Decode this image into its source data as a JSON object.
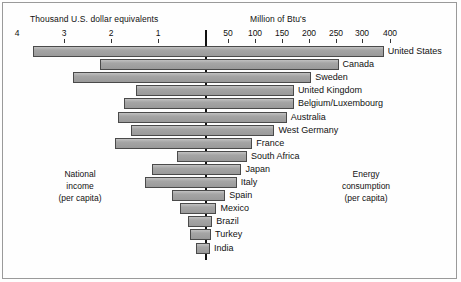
{
  "chart_data": {
    "type": "bar",
    "title": "",
    "orientation": "diverging-horizontal",
    "axis_left": {
      "title": "Thousand U.S. dollar equivalents",
      "label": "National income (per capita)",
      "tick_labels": [
        "4",
        "3",
        "2",
        "1"
      ],
      "tick_values": [
        4,
        3,
        2,
        1
      ],
      "direction": "right-to-left",
      "units": "Thousand U.S. dollar equivalents"
    },
    "axis_right": {
      "title": "Million of Btu's",
      "label": "Energy consumption (per capita)",
      "tick_labels": [
        "50",
        "100",
        "150",
        "200",
        "250",
        "300",
        "400"
      ],
      "tick_values": [
        50,
        100,
        150,
        200,
        250,
        300,
        400
      ],
      "direction": "left-to-right",
      "units": "Million of Btu's"
    },
    "note_left": {
      "line1": "National",
      "line2": "income",
      "line3": "(per capita)"
    },
    "note_right": {
      "line1": "Energy",
      "line2": "consumption",
      "line3": "(per capita)"
    },
    "categories": [
      "United States",
      "Canada",
      "Sweden",
      "United Kingdom",
      "Belgium/Luxembourg",
      "Australia",
      "West Germany",
      "France",
      "South Africa",
      "Japan",
      "Italy",
      "Spain",
      "Mexico",
      "Brazil",
      "Turkey",
      "India"
    ],
    "series": [
      {
        "name": "National income (per capita), thousand U.S. dollar equivalents",
        "side": "left",
        "values": [
          3.65,
          2.23,
          2.81,
          1.46,
          1.72,
          1.85,
          1.57,
          1.91,
          0.6,
          1.13,
          1.27,
          0.7,
          0.53,
          0.36,
          0.32,
          0.19
        ]
      },
      {
        "name": "Energy consumption (per capita), million of Btu's",
        "side": "right",
        "values": [
          378,
          255,
          204,
          172,
          172,
          159,
          136,
          95,
          85,
          75,
          66,
          44,
          25,
          16,
          13,
          11
        ]
      }
    ],
    "bars": [
      {
        "label": "United States",
        "income": 3.65,
        "energy": 378
      },
      {
        "label": "Canada",
        "income": 2.23,
        "energy": 255
      },
      {
        "label": "Sweden",
        "income": 2.81,
        "energy": 204
      },
      {
        "label": "United Kingdom",
        "income": 1.46,
        "energy": 172
      },
      {
        "label": "Belgium/Luxembourg",
        "income": 1.72,
        "energy": 172
      },
      {
        "label": "Australia",
        "income": 1.85,
        "energy": 159
      },
      {
        "label": "West Germany",
        "income": 1.57,
        "energy": 136
      },
      {
        "label": "France",
        "income": 1.91,
        "energy": 95
      },
      {
        "label": "South Africa",
        "income": 0.6,
        "energy": 85
      },
      {
        "label": "Japan",
        "income": 1.13,
        "energy": 75
      },
      {
        "label": "Italy",
        "income": 1.27,
        "energy": 66
      },
      {
        "label": "Spain",
        "income": 0.7,
        "energy": 44
      },
      {
        "label": "Mexico",
        "income": 0.53,
        "energy": 25
      },
      {
        "label": "Brazil",
        "income": 0.36,
        "energy": 16
      },
      {
        "label": "Turkey",
        "income": 0.32,
        "energy": 13
      },
      {
        "label": "India",
        "income": 0.19,
        "energy": 11
      }
    ],
    "colors": {
      "bar_fill": "#a0a0a0",
      "bar_stroke": "#4a4a4a",
      "axis": "#111111",
      "background": "#ffffff"
    },
    "grid": false,
    "legend": "none"
  },
  "geometry": {
    "center_x": 205,
    "left_px_per_unit": 47.0,
    "first_row_y": 46,
    "row_pitch": 13.1,
    "bar_height": 11,
    "right_ticks_px": [
      228,
      255,
      282,
      309,
      336,
      362,
      390
    ],
    "left_ticks_px": [
      62,
      109,
      156
    ]
  }
}
